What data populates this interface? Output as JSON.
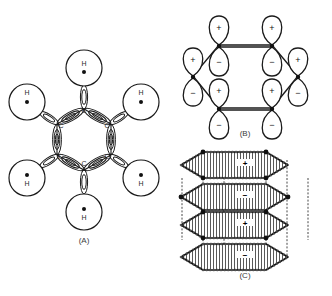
{
  "figure": {
    "background_color": "#ffffff",
    "stroke_color": "#1a1a1a"
  },
  "panels": [
    {
      "id": "A",
      "caption": "(A)",
      "caption_x": 84,
      "caption_y": 243,
      "description": "sigma-bond framework of benzene",
      "atom_label": "C",
      "hydrogen_label": "H",
      "carbons": [
        {
          "label": "C",
          "x": 84,
          "y": 109,
          "lx": 84,
          "ly": 113
        },
        {
          "label": "C",
          "x": 111,
          "y": 124,
          "lx": 107,
          "ly": 128
        },
        {
          "label": "C",
          "x": 111,
          "y": 155,
          "lx": 107,
          "ly": 159
        },
        {
          "label": "C",
          "x": 84,
          "y": 170,
          "lx": 84,
          "ly": 166
        },
        {
          "label": "C",
          "x": 57,
          "y": 155,
          "lx": 61,
          "ly": 159
        },
        {
          "label": "C",
          "x": 57,
          "y": 124,
          "lx": 61,
          "ly": 128
        }
      ],
      "hydrogens": [
        {
          "label": "H",
          "cx": 84,
          "cy": 68,
          "r": 18,
          "dot_dy": 4,
          "text_dy": -2,
          "from_x": 84,
          "from_y": 109,
          "to_x": 84,
          "to_y": 86
        },
        {
          "label": "H",
          "cx": 141,
          "cy": 102,
          "r": 18,
          "dot_dy": 0,
          "text_dy": -7,
          "from_x": 111,
          "from_y": 124,
          "to_x": 127,
          "to_y": 112
        },
        {
          "label": "H",
          "cx": 141,
          "cy": 178,
          "r": 18,
          "dot_dy": -3,
          "text_dy": 7,
          "from_x": 111,
          "from_y": 155,
          "to_x": 127,
          "to_y": 167
        },
        {
          "label": "H",
          "cx": 84,
          "cy": 212,
          "r": 18,
          "dot_dy": -3,
          "text_dy": 8,
          "from_x": 84,
          "from_y": 170,
          "to_x": 84,
          "to_y": 194
        },
        {
          "label": "H",
          "cx": 27,
          "cy": 178,
          "r": 18,
          "dot_dy": -3,
          "text_dy": 7,
          "from_x": 57,
          "from_y": 155,
          "to_x": 41,
          "to_y": 167
        },
        {
          "label": "H",
          "cx": 27,
          "cy": 102,
          "r": 18,
          "dot_dy": 0,
          "text_dy": -7,
          "from_x": 57,
          "from_y": 124,
          "to_x": 41,
          "to_y": 112
        }
      ]
    },
    {
      "id": "B",
      "caption": "(B)",
      "caption_x": 245,
      "caption_y": 136,
      "description": "unhybridized p-orbitals on each carbon",
      "plus_sign": "+",
      "minus_sign": "−",
      "orbitals": [
        {
          "nx": 219,
          "ny": 45,
          "top": "+",
          "bottom": "−"
        },
        {
          "nx": 272,
          "ny": 45,
          "top": "+",
          "bottom": "−"
        },
        {
          "nx": 298,
          "ny": 76,
          "top": "+",
          "bottom": "−"
        },
        {
          "nx": 272,
          "ny": 108,
          "top": "+",
          "bottom": "−"
        },
        {
          "nx": 219,
          "ny": 108,
          "top": "+",
          "bottom": "−"
        },
        {
          "nx": 193,
          "ny": 76,
          "top": "+",
          "bottom": "−"
        }
      ],
      "ring_bonds": [
        [
          219,
          45,
          272,
          45
        ],
        [
          272,
          45,
          298,
          76
        ],
        [
          298,
          76,
          272,
          108
        ],
        [
          272,
          108,
          219,
          108
        ],
        [
          219,
          108,
          193,
          76
        ],
        [
          193,
          76,
          219,
          45
        ]
      ]
    },
    {
      "id": "C",
      "caption": "(C)",
      "caption_x": 245,
      "caption_y": 278,
      "description": "delocalized pi electron cloud above and below the ring plane",
      "clouds": [
        {
          "cy": 162,
          "sign": "+",
          "sign_x": 245,
          "sign_y": 163
        },
        {
          "cy": 194,
          "sign": "−",
          "sign_x": 245,
          "sign_y": 195
        },
        {
          "cy": 222,
          "sign": "+",
          "sign_x": 245,
          "sign_y": 223
        },
        {
          "cy": 254,
          "sign": "−",
          "sign_x": 245,
          "sign_y": 255
        }
      ]
    }
  ]
}
